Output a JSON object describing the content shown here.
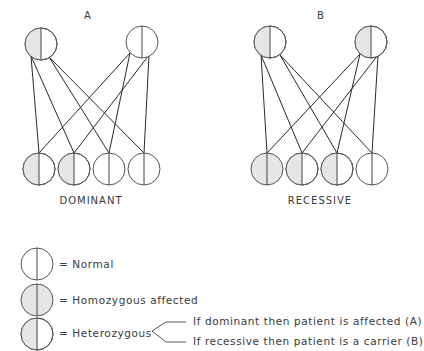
{
  "colors": {
    "shade": "#e6e6e6",
    "stroke": "#555555",
    "line": "#2a2a2a",
    "text": "#3a3a3a"
  },
  "panels": [
    {
      "label": "A",
      "caption": "DOMINANT",
      "parents": [
        {
          "cx": 41,
          "cy": 44,
          "state": "heterozygous"
        },
        {
          "cx": 142,
          "cy": 42,
          "state": "normal"
        }
      ],
      "children": [
        {
          "cx": 39,
          "cy": 169,
          "state": "heterozygous"
        },
        {
          "cx": 74,
          "cy": 169,
          "state": "heterozygous"
        },
        {
          "cx": 109,
          "cy": 169,
          "state": "normal"
        },
        {
          "cx": 144,
          "cy": 169,
          "state": "normal"
        }
      ]
    },
    {
      "label": "B",
      "caption": "RECESSIVE",
      "parents": [
        {
          "cx": 270,
          "cy": 42,
          "state": "heterozygous"
        },
        {
          "cx": 371,
          "cy": 42,
          "state": "heterozygous"
        }
      ],
      "children": [
        {
          "cx": 267,
          "cy": 169,
          "state": "homozygous_affected"
        },
        {
          "cx": 302,
          "cy": 169,
          "state": "heterozygous"
        },
        {
          "cx": 337,
          "cy": 169,
          "state": "heterozygous"
        },
        {
          "cx": 372,
          "cy": 169,
          "state": "normal"
        }
      ]
    }
  ],
  "legend": {
    "items": [
      {
        "state": "normal",
        "text": "= Normal"
      },
      {
        "state": "homozygous_affected",
        "text": "= Homozygous affected"
      },
      {
        "state": "heterozygous",
        "text": "= Heterozygous"
      }
    ],
    "branches": [
      "If dominant then patient is affected (A)",
      "If recessive then patient is a carrier (B)"
    ]
  }
}
